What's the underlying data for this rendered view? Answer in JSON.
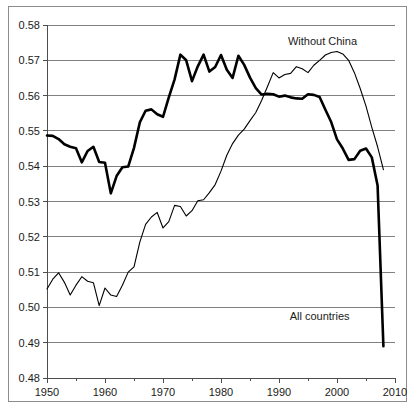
{
  "chart_data": {
    "type": "line",
    "title": "",
    "subtitle": "",
    "xlabel": "",
    "ylabel": "",
    "xlim": [
      1950,
      2010
    ],
    "ylim": [
      0.48,
      0.58
    ],
    "grid": true,
    "legend_position": "inline-annotations",
    "y_ticks": [
      "0.58",
      "0.57",
      "0.56",
      "0.55",
      "0.54",
      "0.53",
      "0.52",
      "0.51",
      "0.50",
      "0.49",
      "0.48"
    ],
    "y_tick_values": [
      0.58,
      0.57,
      0.56,
      0.55,
      0.54,
      0.53,
      0.52,
      0.51,
      0.5,
      0.49,
      0.48
    ],
    "x_ticks": [
      "1950",
      "1960",
      "1970",
      "1980",
      "1990",
      "2000",
      "2010"
    ],
    "x_tick_values": [
      1950,
      1960,
      1970,
      1980,
      1990,
      2000,
      2010
    ],
    "x_minor_tick_values": [
      1955,
      1965,
      1975,
      1985,
      1995,
      2005
    ],
    "annotations": [
      {
        "name": "without-china-label",
        "text": "Without China",
        "x": 1997.5,
        "y": 0.5755
      },
      {
        "name": "all-countries-label",
        "text": "All countries",
        "x": 1997.0,
        "y": 0.4975
      }
    ],
    "series": [
      {
        "name": "All countries",
        "style": "thick",
        "color": "#000000",
        "x": [
          1950,
          1951,
          1952,
          1953,
          1954,
          1955,
          1956,
          1957,
          1958,
          1959,
          1960,
          1961,
          1962,
          1963,
          1964,
          1965,
          1966,
          1967,
          1968,
          1969,
          1970,
          1971,
          1972,
          1973,
          1974,
          1975,
          1976,
          1977,
          1978,
          1979,
          1980,
          1981,
          1982,
          1983,
          1984,
          1985,
          1986,
          1987,
          1988,
          1989,
          1990,
          1991,
          1992,
          1993,
          1994,
          1995,
          1996,
          1997,
          1998,
          1999,
          2000,
          2001,
          2002,
          2003,
          2004,
          2005,
          2006,
          2007,
          2008
        ],
        "values": [
          0.5487,
          0.5486,
          0.5477,
          0.5462,
          0.5455,
          0.5451,
          0.5411,
          0.5443,
          0.5455,
          0.5412,
          0.541,
          0.5323,
          0.5372,
          0.5397,
          0.5399,
          0.5452,
          0.5524,
          0.5557,
          0.5561,
          0.5547,
          0.554,
          0.5595,
          0.5646,
          0.5716,
          0.57,
          0.5641,
          0.5683,
          0.5716,
          0.5668,
          0.5681,
          0.5715,
          0.5673,
          0.565,
          0.5713,
          0.5687,
          0.5651,
          0.5621,
          0.5603,
          0.5605,
          0.5604,
          0.5597,
          0.56,
          0.5595,
          0.5592,
          0.5591,
          0.5604,
          0.5602,
          0.5596,
          0.556,
          0.5525,
          0.5476,
          0.545,
          0.5418,
          0.542,
          0.5444,
          0.545,
          0.5425,
          0.5345,
          0.489
        ]
      },
      {
        "name": "Without China",
        "style": "thin",
        "color": "#000000",
        "x": [
          1950,
          1951,
          1952,
          1953,
          1954,
          1955,
          1956,
          1957,
          1958,
          1959,
          1960,
          1961,
          1962,
          1963,
          1964,
          1965,
          1966,
          1967,
          1968,
          1969,
          1970,
          1971,
          1972,
          1973,
          1974,
          1975,
          1976,
          1977,
          1978,
          1979,
          1980,
          1981,
          1982,
          1983,
          1984,
          1985,
          1986,
          1987,
          1988,
          1989,
          1990,
          1991,
          1992,
          1993,
          1994,
          1995,
          1996,
          1997,
          1998,
          1999,
          2000,
          2001,
          2002,
          2003,
          2004,
          2005,
          2006,
          2007,
          2008
        ],
        "values": [
          0.5052,
          0.508,
          0.5098,
          0.5071,
          0.5035,
          0.5063,
          0.5087,
          0.5074,
          0.507,
          0.5005,
          0.5055,
          0.5035,
          0.5031,
          0.5063,
          0.51,
          0.5115,
          0.5185,
          0.5235,
          0.5256,
          0.5269,
          0.5225,
          0.5243,
          0.5289,
          0.5286,
          0.5259,
          0.5274,
          0.5302,
          0.5305,
          0.5325,
          0.5348,
          0.5386,
          0.5431,
          0.5464,
          0.5488,
          0.5505,
          0.5529,
          0.5552,
          0.5586,
          0.5625,
          0.5665,
          0.565,
          0.566,
          0.5663,
          0.5682,
          0.5676,
          0.5665,
          0.5686,
          0.57,
          0.5715,
          0.5722,
          0.5725,
          0.5718,
          0.57,
          0.5665,
          0.562,
          0.557,
          0.551,
          0.5455,
          0.539
        ]
      }
    ]
  }
}
